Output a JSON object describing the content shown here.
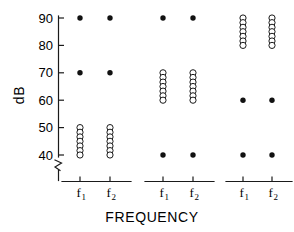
{
  "chart_data": {
    "type": "scatter",
    "title": "",
    "xlabel": "FREQUENCY",
    "ylabel": "dB",
    "ylim": [
      35,
      94
    ],
    "yticks": [
      40,
      50,
      60,
      70,
      80,
      90
    ],
    "ytick_labels": [
      "40",
      "50",
      "60",
      "70",
      "80",
      "90"
    ],
    "y_axis_break": true,
    "grid": false,
    "legend": null,
    "panels": [
      {
        "name": "panel-1",
        "xtick_labels": [
          "f",
          "f"
        ],
        "xtick_subscripts": [
          "1",
          "2"
        ],
        "series": [
          {
            "name": "f1",
            "marker": "filled-circle",
            "values": [
              90,
              70
            ]
          },
          {
            "name": "f1-open",
            "marker": "open-circle",
            "values": [
              50,
              48.3,
              46.6,
              45,
              43.3,
              41.6,
              40
            ]
          },
          {
            "name": "f2",
            "marker": "filled-circle",
            "values": [
              90,
              70
            ]
          },
          {
            "name": "f2-open",
            "marker": "open-circle",
            "values": [
              50,
              48.3,
              46.6,
              45,
              43.3,
              41.6,
              40
            ]
          }
        ]
      },
      {
        "name": "panel-2",
        "xtick_labels": [
          "f",
          "f"
        ],
        "xtick_subscripts": [
          "1",
          "2"
        ],
        "series": [
          {
            "name": "f1",
            "marker": "filled-circle",
            "values": [
              90,
              40
            ]
          },
          {
            "name": "f1-open",
            "marker": "open-circle",
            "values": [
              70,
              68.3,
              66.6,
              65,
              63.3,
              61.6,
              60
            ]
          },
          {
            "name": "f2",
            "marker": "filled-circle",
            "values": [
              90,
              40
            ]
          },
          {
            "name": "f2-open",
            "marker": "open-circle",
            "values": [
              70,
              68.3,
              66.6,
              65,
              63.3,
              61.6,
              60
            ]
          }
        ]
      },
      {
        "name": "panel-3",
        "xtick_labels": [
          "f",
          "f"
        ],
        "xtick_subscripts": [
          "1",
          "2"
        ],
        "series": [
          {
            "name": "f1",
            "marker": "filled-circle",
            "values": [
              60,
              40
            ]
          },
          {
            "name": "f1-open",
            "marker": "open-circle",
            "values": [
              90,
              88.3,
              86.6,
              85,
              83.3,
              81.6,
              80
            ]
          },
          {
            "name": "f2",
            "marker": "filled-circle",
            "values": [
              60,
              40
            ]
          },
          {
            "name": "f2-open",
            "marker": "open-circle",
            "values": [
              90,
              88.3,
              86.6,
              85,
              83.3,
              81.6,
              80
            ]
          }
        ]
      }
    ]
  },
  "colors": {
    "axis": "#1a1a1a",
    "filled_marker": "#111111",
    "open_marker_stroke": "#1a1a1a",
    "background": "#ffffff"
  }
}
